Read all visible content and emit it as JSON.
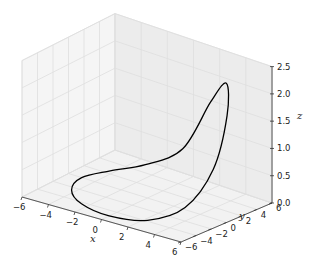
{
  "chart_data": {
    "type": "line",
    "projection": "3d",
    "title": "",
    "xlabel": "x",
    "ylabel": "y",
    "zlabel": "z",
    "xlim": [
      -6,
      6
    ],
    "ylim": [
      -6,
      6
    ],
    "zlim": [
      0,
      2.5
    ],
    "xticks": [
      "−6",
      "−4",
      "−2",
      "0",
      "2",
      "4",
      "6"
    ],
    "xtick_values": [
      -6,
      -4,
      -2,
      0,
      2,
      4,
      6
    ],
    "yticks": [
      "−6",
      "−4",
      "−2",
      "0",
      "2",
      "4",
      "6"
    ],
    "ytick_values": [
      -6,
      -4,
      -2,
      0,
      2,
      4,
      6
    ],
    "zticks": [
      "0.0",
      "0.5",
      "1.0",
      "1.5",
      "2.0",
      "2.5"
    ],
    "ztick_values": [
      0,
      0.5,
      1.0,
      1.5,
      2.0,
      2.5
    ],
    "grid": true,
    "series": [
      {
        "name": "curve",
        "color": "#000000",
        "description": "closed parametric curve x=r cos t, y=r sin t, z rising to ~2.1 near (x≈5, y≈4)",
        "x": [
          -5.0,
          -4.3,
          -2.5,
          0.0,
          2.5,
          4.3,
          5.0,
          4.6,
          3.5,
          2.0,
          0.0,
          -2.5,
          -4.3,
          -5.0
        ],
        "y": [
          0.0,
          -2.5,
          -4.3,
          -5.0,
          -4.3,
          -2.5,
          0.0,
          2.5,
          4.3,
          4.8,
          4.6,
          4.0,
          2.5,
          0.0
        ],
        "z": [
          0.0,
          0.0,
          0.0,
          0.0,
          0.05,
          0.3,
          0.9,
          1.7,
          2.1,
          1.6,
          0.6,
          0.15,
          0.0,
          0.0
        ]
      }
    ]
  }
}
